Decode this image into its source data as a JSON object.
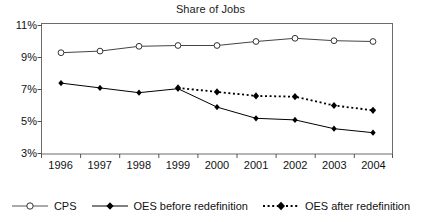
{
  "chart_data": {
    "type": "line",
    "title": "Share of Jobs",
    "xlabel": "",
    "ylabel": "",
    "categories": [
      "1996",
      "1997",
      "1998",
      "1999",
      "2000",
      "2001",
      "2002",
      "2003",
      "2004"
    ],
    "ylim": [
      3,
      11
    ],
    "yticks": [
      "3%",
      "5%",
      "7%",
      "9%",
      "11%"
    ],
    "ytick_values": [
      3,
      5,
      7,
      9,
      11
    ],
    "grid": false,
    "legend_position": "bottom",
    "series": [
      {
        "name": "CPS",
        "marker": "open-circle",
        "line_style": "solid",
        "color": "#444444",
        "x": [
          "1996",
          "1997",
          "1998",
          "1999",
          "2000",
          "2001",
          "2002",
          "2003",
          "2004"
        ],
        "values": [
          9.3,
          9.4,
          9.7,
          9.75,
          9.75,
          10.0,
          10.2,
          10.05,
          10.0
        ]
      },
      {
        "name": "OES before redefinition",
        "marker": "filled-diamond",
        "line_style": "solid",
        "color": "#000000",
        "x": [
          "1996",
          "1997",
          "1998",
          "1999",
          "2000",
          "2001",
          "2002",
          "2003",
          "2004"
        ],
        "values": [
          7.4,
          7.1,
          6.8,
          7.05,
          5.9,
          5.2,
          5.1,
          4.55,
          4.3
        ]
      },
      {
        "name": "OES after redefinition",
        "marker": "filled-diamond",
        "line_style": "dotted",
        "color": "#000000",
        "x": [
          "1999",
          "2000",
          "2001",
          "2002",
          "2003",
          "2004"
        ],
        "values": [
          7.1,
          6.85,
          6.6,
          6.55,
          6.0,
          5.7
        ]
      }
    ]
  },
  "legend": {
    "items": [
      {
        "label": "CPS",
        "key": "open-circle-solid-line"
      },
      {
        "label": "OES before redefinition",
        "key": "filled-diamond-solid-line"
      },
      {
        "label": "OES after redefinition",
        "key": "filled-diamond-dotted-line"
      }
    ]
  },
  "colors": {
    "plot_border": "#6b6b6b",
    "axis": "#555555",
    "cps_line": "#555555",
    "oes_line": "#000000",
    "text": "#111111",
    "background": "#ffffff"
  }
}
